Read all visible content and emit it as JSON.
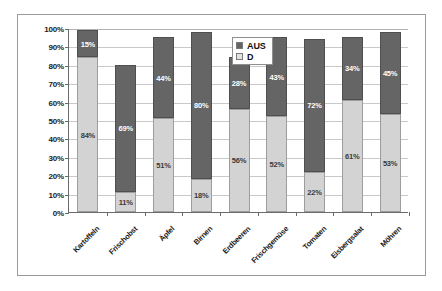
{
  "chart_data": {
    "type": "bar",
    "title": "",
    "subtitle": "",
    "xlabel": "",
    "ylabel": "",
    "stacked": true,
    "grid": true,
    "legend_position": "top-right",
    "ylim": [
      0,
      100
    ],
    "ytick_labels": [
      "100%",
      "90%",
      "80%",
      "70%",
      "60%",
      "50%",
      "40%",
      "30%",
      "20%",
      "10%",
      "0%"
    ],
    "ytick_values": [
      100,
      90,
      80,
      70,
      60,
      50,
      40,
      30,
      20,
      10,
      0
    ],
    "categories": [
      "Kartoffeln",
      "Frischobst",
      "Äpfel",
      "Birnen",
      "Erdbeeren",
      "Frischgemüse",
      "Tomaten",
      "Eisbergsalat",
      "Möhren"
    ],
    "series": [
      {
        "name": "D",
        "color": "#d3d3d3",
        "values": [
          84,
          11,
          51,
          18,
          56,
          52,
          22,
          61,
          53
        ],
        "labels": [
          "84%",
          "11%",
          "51%",
          "18%",
          "56%",
          "52%",
          "22%",
          "61%",
          "53%"
        ]
      },
      {
        "name": "AUS",
        "color": "#656565",
        "values": [
          15,
          69,
          44,
          80,
          28,
          43,
          72,
          34,
          45
        ],
        "labels": [
          "15%",
          "69%",
          "44%",
          "80%",
          "28%",
          "43%",
          "72%",
          "34%",
          "45%"
        ]
      }
    ],
    "totals": [
      99,
      80,
      95,
      98,
      84,
      95,
      94,
      95,
      98
    ]
  },
  "legend": {
    "entries": [
      {
        "label": "AUS",
        "swatch": "dark-gray-swatch-icon"
      },
      {
        "label": "D",
        "swatch": "light-gray-swatch-icon"
      }
    ]
  },
  "colors": {
    "series_d": "#d3d3d3",
    "series_aus": "#656565",
    "gridline": "#c9c9c9",
    "axis": "#6b6b6b",
    "frame": "#9a9a9a",
    "text": "#1a1a1a"
  }
}
